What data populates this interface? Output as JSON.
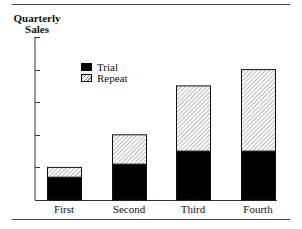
{
  "chart_data": {
    "type": "bar",
    "stacked": true,
    "title": "",
    "ylabel": "Quarterly Sales",
    "ylabel_lines": [
      "Quarterly",
      "Sales"
    ],
    "xlabel": "",
    "categories": [
      "First",
      "Second",
      "Third",
      "Fourth"
    ],
    "series": [
      {
        "name": "Trial",
        "values": [
          0.7,
          1.1,
          1.5,
          1.5
        ],
        "fill": "solid",
        "color": "#000000"
      },
      {
        "name": "Repeat",
        "values": [
          0.3,
          0.9,
          2.0,
          2.5
        ],
        "fill": "hatched",
        "color": "#888888"
      }
    ],
    "totals": [
      1.0,
      2.0,
      3.5,
      4.0
    ],
    "ylim": [
      0,
      5
    ],
    "yticks": [
      0,
      1,
      2,
      3,
      4,
      5
    ],
    "ytick_labels_shown": false,
    "grid": false,
    "legend_position": "upper-left-inside"
  },
  "legend": {
    "items": [
      {
        "label": "Trial"
      },
      {
        "label": "Repeat"
      }
    ]
  }
}
